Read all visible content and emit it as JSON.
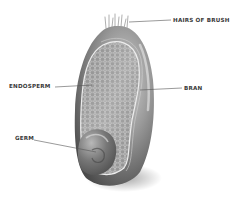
{
  "diagram": {
    "labels": {
      "hairs": "HAIRS OF BRUSH",
      "endosperm": "ENDOSPERM",
      "bran": "BRAN",
      "germ": "GERM"
    },
    "colors": {
      "background": "#ffffff",
      "label_text": "#3a3a3a",
      "leader_line": "#555555",
      "bran_dark": "#5a5a5a",
      "bran_light": "#bdbdbd",
      "endosperm_fill": "#9e9e9e",
      "cell_outline": "#e8e8e8",
      "germ": "#6e6e6e"
    }
  }
}
